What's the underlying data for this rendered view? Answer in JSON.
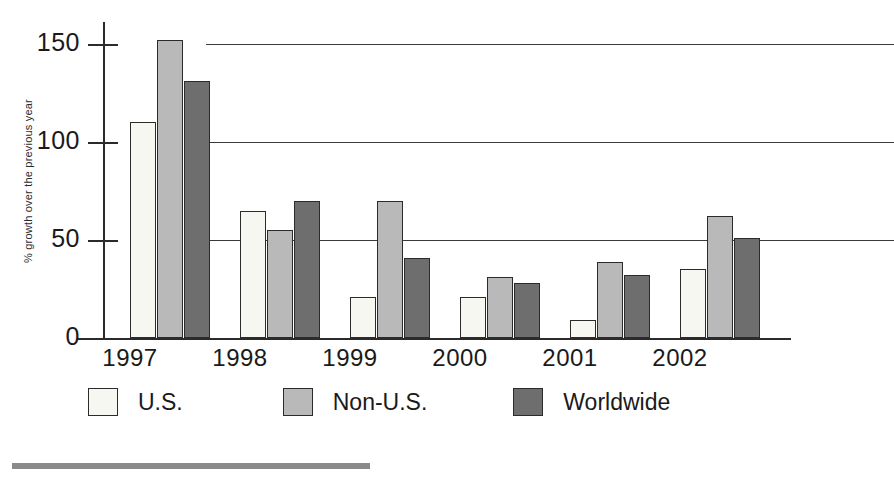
{
  "chart_data": {
    "type": "bar",
    "title": "",
    "subtitle": "",
    "xlabel": "",
    "ylabel": "% growth over the previous year",
    "categories": [
      "1997",
      "1998",
      "1999",
      "2000",
      "2001",
      "2002"
    ],
    "series": [
      {
        "name": "U.S.",
        "color": "#f7f7f2",
        "values": [
          110,
          65,
          21,
          21,
          9,
          35
        ]
      },
      {
        "name": "Non-U.S.",
        "color": "#b9b9b9",
        "values": [
          152,
          55,
          70,
          31,
          39,
          62
        ]
      },
      {
        "name": "Worldwide",
        "color": "#6e6e6e",
        "values": [
          131,
          70,
          41,
          28,
          32,
          51
        ]
      }
    ],
    "ylim": [
      0,
      160
    ],
    "yticks": [
      "0",
      "50",
      "100",
      "150"
    ],
    "ytick_values": [
      0,
      50,
      100,
      150
    ],
    "grid": true,
    "grid_axis": "y",
    "legend_position": "bottom",
    "bar_border_color": "#2b2b2b",
    "axis_color": "#2b2b2b",
    "background_color": "#ffffff"
  },
  "legend": {
    "entries": [
      {
        "label": "U.S."
      },
      {
        "label": "Non-U.S."
      },
      {
        "label": "Worldwide"
      }
    ]
  },
  "footer": {
    "rule_color": "#8a8a8a"
  }
}
